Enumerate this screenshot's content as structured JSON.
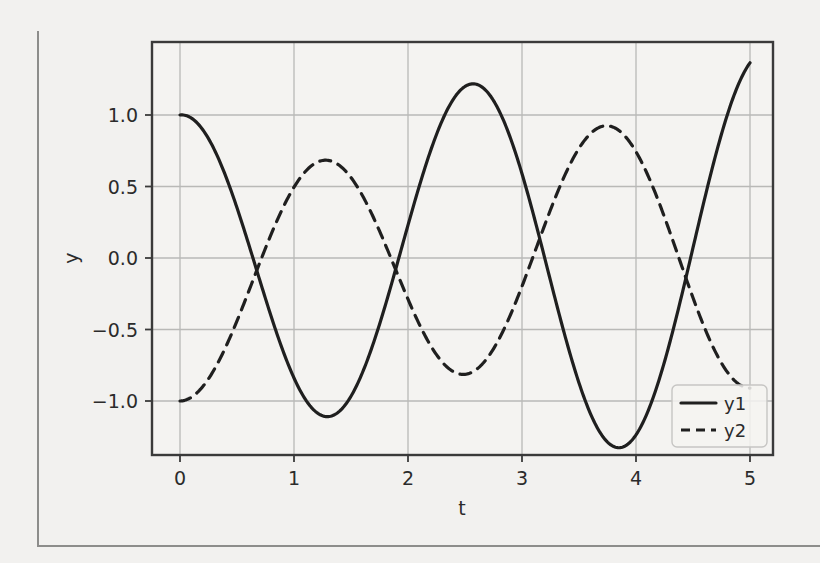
{
  "figure": {
    "background_color": "#f2f1ef",
    "axes_color": "#3a3a3a",
    "grid_color": "#b9b9b7",
    "page_edge_color": "#8d8d8b"
  },
  "chart_data": {
    "type": "line",
    "title": "",
    "xlabel": "t",
    "ylabel": "y",
    "xlim": [
      -0.25,
      5.25
    ],
    "ylim": [
      -1.45,
      1.55
    ],
    "grid": true,
    "xticks": [
      "0",
      "1",
      "2",
      "3",
      "4",
      "5"
    ],
    "xtick_values": [
      0,
      1,
      2,
      3,
      4,
      5
    ],
    "yticks": [
      "1.0",
      "0.5",
      "0.0",
      "−0.5",
      "−1.0"
    ],
    "ytick_values": [
      1.0,
      0.5,
      0.0,
      -0.5,
      -1.0
    ],
    "legend_position": "lower right",
    "series": [
      {
        "name": "y1",
        "style": "solid",
        "color": "#1f1f1f",
        "linewidth": 3,
        "x": [
          0.0,
          0.1,
          0.2,
          0.3,
          0.4,
          0.5,
          0.6,
          0.7,
          0.8,
          0.9,
          1.0,
          1.1,
          1.2,
          1.3,
          1.4,
          1.5,
          1.6,
          1.7,
          1.8,
          1.9,
          2.0,
          2.1,
          2.2,
          2.3,
          2.4,
          2.5,
          2.6,
          2.7,
          2.8,
          2.9,
          3.0,
          3.1,
          3.2,
          3.3,
          3.4,
          3.5,
          3.6,
          3.7,
          3.8,
          3.9,
          4.0,
          4.1,
          4.2,
          4.3,
          4.4,
          4.5,
          4.6,
          4.7,
          4.8,
          4.9,
          5.0
        ],
        "y": [
          1.0,
          0.979,
          0.92,
          0.826,
          0.702,
          0.554,
          0.389,
          0.214,
          0.037,
          -0.136,
          -0.299,
          -0.446,
          -0.572,
          -0.673,
          -0.745,
          -0.786,
          -0.794,
          -0.769,
          -0.712,
          -0.625,
          -0.511,
          -0.374,
          -0.219,
          -0.053,
          0.119,
          0.29,
          0.453,
          0.602,
          0.73,
          0.833,
          0.906,
          0.947,
          0.953,
          0.925,
          0.864,
          0.772,
          0.653,
          0.511,
          0.352,
          0.182,
          0.008,
          -0.165,
          -0.33,
          -0.481,
          -0.612,
          -0.718,
          -0.795,
          -0.84,
          -0.851,
          -0.828,
          -0.772
        ]
      },
      {
        "name": "y2",
        "style": "dashed",
        "color": "#1f1f1f",
        "linewidth": 3,
        "x": [
          0.0,
          0.1,
          0.2,
          0.3,
          0.4,
          0.5,
          0.6,
          0.7,
          0.8,
          0.9,
          1.0,
          1.1,
          1.2,
          1.3,
          1.4,
          1.5,
          1.6,
          1.7,
          1.8,
          1.9,
          2.0,
          2.1,
          2.2,
          2.3,
          2.4,
          2.5,
          2.6,
          2.7,
          2.8,
          2.9,
          3.0,
          3.1,
          3.2,
          3.3,
          3.4,
          3.5,
          3.6,
          3.7,
          3.8,
          3.9,
          4.0,
          4.1,
          4.2,
          4.3,
          4.4,
          4.5,
          4.6,
          4.7,
          4.8,
          4.9,
          5.0
        ],
        "y": [
          -1.0,
          -0.99,
          -0.96,
          -0.91,
          -0.845,
          -0.765,
          -0.67,
          -0.565,
          -0.45,
          -0.33,
          -0.205,
          -0.08,
          0.04,
          0.155,
          0.26,
          0.35,
          0.425,
          0.48,
          0.515,
          0.53,
          0.52,
          0.49,
          0.44,
          0.37,
          0.285,
          0.185,
          0.08,
          -0.03,
          -0.135,
          -0.23,
          -0.315,
          -0.385,
          -0.435,
          -0.465,
          -0.475,
          -0.46,
          -0.42,
          -0.36,
          -0.275,
          -0.175,
          -0.06,
          0.065,
          0.19,
          0.315,
          0.43,
          0.535,
          0.62,
          0.69,
          0.735,
          0.755,
          0.75
        ]
      }
    ],
    "curve_key_points": {
      "y1_start": 1.0,
      "y1_min1": -1.24,
      "y1_min1_t": 1.27,
      "y1_max1": 1.35,
      "y1_max1_t": 2.56,
      "y1_min2": -1.04,
      "y1_min2_t": 3.9,
      "y1_end": 1.08,
      "y2_start": -1.0,
      "y2_max1": 0.51,
      "y2_max1_t": 1.38,
      "y2_min1": -0.26,
      "y2_min1_t": 2.7,
      "y2_max2": 0.9,
      "y2_max2_t": 3.85,
      "y2_end": -0.69
    }
  },
  "legend": {
    "entries": [
      {
        "label": "y1",
        "style": "solid"
      },
      {
        "label": "y2",
        "style": "dashed"
      }
    ]
  }
}
